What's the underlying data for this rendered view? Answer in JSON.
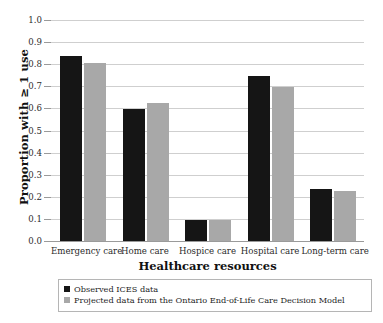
{
  "chart_data": {
    "type": "bar",
    "title": "",
    "xlabel": "Healthcare resources",
    "ylabel": "Proportion with ≥ 1 use",
    "ylim": [
      0.0,
      1.0
    ],
    "grid": true,
    "legend_position": "bottom",
    "categories": [
      "Emergency care",
      "Home care",
      "Hospice care",
      "Hospital care",
      "Long-term care"
    ],
    "ytick_labels": [
      "1.0",
      "0.9",
      "0.8",
      "0.7",
      "0.6",
      "0.5",
      "0.4",
      "0.3",
      "0.2",
      "0.1",
      "0.0"
    ],
    "ytick_values": [
      1.0,
      0.9,
      0.8,
      0.7,
      0.6,
      0.5,
      0.4,
      0.3,
      0.2,
      0.1,
      0.0
    ],
    "series": [
      {
        "name": "Observed ICES data",
        "color": "#151515",
        "values": [
          0.837,
          0.598,
          0.097,
          0.745,
          0.235
        ]
      },
      {
        "name": "Projected data from the Ontario End-of-Life Care Decision Model",
        "color": "#a8a8a8",
        "values": [
          0.805,
          0.626,
          0.093,
          0.697,
          0.225
        ]
      }
    ]
  },
  "legend": {
    "items": [
      {
        "label": "Observed ICES data",
        "swatch": "observed"
      },
      {
        "label": "Projected data from the Ontario End-of-Life Care Decision Model",
        "swatch": "projected"
      }
    ]
  }
}
